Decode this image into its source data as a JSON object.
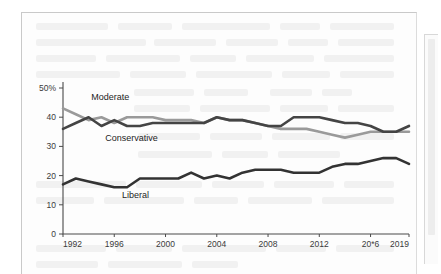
{
  "panel": {
    "name": "document-page"
  },
  "scrollbar": {
    "name": "vertical-scrollbar"
  },
  "chart_data": {
    "type": "line",
    "title": "",
    "subtitle": "",
    "xlabel": "",
    "ylabel": "",
    "grid": false,
    "legend_position": "inline-labels",
    "xlim": [
      1992,
      2019
    ],
    "ylim": [
      0,
      50
    ],
    "yticks": [
      "0",
      "10",
      "20",
      "30",
      "40",
      "50%"
    ],
    "ytick_values": [
      0,
      10,
      20,
      30,
      40,
      50
    ],
    "xticks": [
      "1992",
      "1996",
      "2000",
      "2004",
      "2008",
      "2012",
      "20*6",
      "2019"
    ],
    "xtick_values": [
      1992,
      1996,
      2000,
      2004,
      2008,
      2012,
      2016,
      2019
    ],
    "x": [
      1992,
      1993,
      1994,
      1995,
      1996,
      1997,
      1998,
      1999,
      2000,
      2001,
      2002,
      2003,
      2004,
      2005,
      2006,
      2007,
      2008,
      2009,
      2010,
      2011,
      2012,
      2013,
      2014,
      2015,
      2016,
      2017,
      2018,
      2019
    ],
    "series": [
      {
        "name": "Moderate",
        "color": "#9a9a9a",
        "label_x": 1994.2,
        "label_y": 46.0,
        "values": [
          43,
          41,
          39,
          40,
          38,
          40,
          40,
          40,
          39,
          39,
          39,
          38,
          40,
          39,
          39,
          38,
          37,
          36,
          36,
          36,
          35,
          34,
          33,
          34,
          35,
          35,
          35,
          35
        ]
      },
      {
        "name": "Conservative",
        "color": "#444444",
        "label_x": 1995.3,
        "label_y": 32.0,
        "values": [
          36,
          38,
          40,
          37,
          39,
          37,
          37,
          38,
          38,
          38,
          38,
          38,
          40,
          39,
          39,
          38,
          37,
          37,
          40,
          40,
          40,
          39,
          38,
          38,
          37,
          35,
          35,
          37
        ]
      },
      {
        "name": "Liberal",
        "color": "#333333",
        "label_x": 1996.6,
        "label_y": 12.5,
        "values": [
          17,
          19,
          18,
          17,
          16,
          16,
          19,
          19,
          19,
          19,
          21,
          19,
          20,
          19,
          21,
          22,
          22,
          22,
          21,
          21,
          21,
          23,
          24,
          24,
          25,
          26,
          26,
          24
        ]
      }
    ]
  }
}
